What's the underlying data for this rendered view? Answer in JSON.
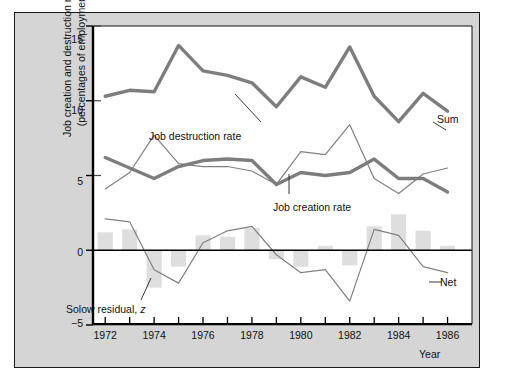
{
  "figure": {
    "background_color": "#d5d5d5",
    "plot_background_color": "#ffffff",
    "border_color": "#1a1a1a"
  },
  "axis_titles": {
    "y_line1": "Job creation and destruction rates",
    "y_line2": "(percentages of employment)",
    "x_title": "Year"
  },
  "annotations": {
    "job_destruction": "Job destruction rate",
    "job_creation": "Job creation rate",
    "solow_residual_prefix": "Solow residual, ",
    "solow_residual_symbol": "z",
    "sum": "Sum",
    "net": "Net"
  },
  "chart_data": {
    "type": "line",
    "title": "",
    "subtitle": "",
    "xlabel": "Year",
    "ylabel": "Job creation and destruction rates (percentages of employment)",
    "xlim": [
      1971.5,
      1987.0
    ],
    "ylim": [
      -5,
      15
    ],
    "yticks": [
      -5,
      0,
      5,
      10,
      15
    ],
    "ytick_labels": [
      "−5",
      "0",
      "5",
      "10",
      "15"
    ],
    "xticks": [
      1972,
      1973,
      1974,
      1975,
      1976,
      1977,
      1978,
      1979,
      1980,
      1981,
      1982,
      1983,
      1984,
      1985,
      1986
    ],
    "xtick_labels_shown": [
      1972,
      1974,
      1976,
      1978,
      1980,
      1982,
      1984,
      1986
    ],
    "grid": false,
    "legend_position": "inline-annotations",
    "zero_line": 0,
    "x": [
      1972,
      1973,
      1974,
      1975,
      1976,
      1977,
      1978,
      1979,
      1980,
      1981,
      1982,
      1983,
      1984,
      1985,
      1986
    ],
    "series": [
      {
        "name": "Sum",
        "style": "thick-line",
        "color": "#7d7d7d",
        "width": 3.4,
        "values": [
          10.3,
          10.7,
          10.6,
          13.7,
          12.0,
          11.7,
          11.2,
          9.6,
          11.6,
          10.9,
          13.6,
          10.3,
          8.6,
          10.5,
          9.3
        ]
      },
      {
        "name": "Job destruction rate",
        "style": "thin-line",
        "color": "#808080",
        "width": 1.2,
        "values": [
          4.1,
          5.2,
          7.7,
          5.8,
          5.6,
          5.6,
          5.3,
          4.4,
          6.6,
          6.4,
          8.4,
          4.8,
          3.8,
          5.1,
          5.5
        ]
      },
      {
        "name": "Job creation rate",
        "style": "thick-line",
        "color": "#7d7d7d",
        "width": 3.4,
        "values": [
          6.2,
          5.5,
          4.8,
          5.6,
          6.0,
          6.1,
          6.0,
          4.4,
          5.2,
          5.0,
          5.2,
          6.1,
          4.8,
          4.8,
          3.9
        ]
      },
      {
        "name": "Solow residual / Net",
        "style": "thin-line",
        "color": "#808080",
        "width": 1.2,
        "values": [
          2.1,
          1.9,
          -1.3,
          -2.2,
          0.5,
          1.3,
          1.6,
          -0.3,
          -1.5,
          -1.3,
          -3.4,
          1.4,
          1.0,
          -1.1,
          -1.5
        ]
      }
    ],
    "bars": {
      "name": "Net employment growth (bars)",
      "color": "#dedede",
      "values": [
        1.2,
        1.4,
        -2.5,
        -1.1,
        1.0,
        0.9,
        1.5,
        -0.6,
        -1.1,
        0.3,
        -1.0,
        1.6,
        2.4,
        1.3,
        0.3
      ]
    }
  }
}
